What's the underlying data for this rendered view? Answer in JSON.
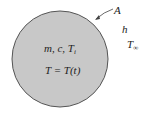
{
  "diagram": {
    "body": {
      "fill": "#c8c8c8",
      "stroke": "#555555",
      "properties": {
        "m": "m",
        "c": "c",
        "Ti_base": "T",
        "Ti_sub": "i"
      },
      "equation": "T = T(t)"
    },
    "labels": {
      "area": "A",
      "heat_transfer_coeff": "h",
      "ambient_base": "T",
      "ambient_sub": "∞"
    }
  }
}
